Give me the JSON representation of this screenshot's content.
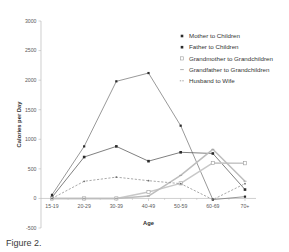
{
  "chart_data": {
    "type": "line",
    "title": "",
    "xlabel": "Age",
    "ylabel": "Calories per Day",
    "categories": [
      "15-19",
      "20-29",
      "30-39",
      "40-49",
      "50-59",
      "60-69",
      "70+"
    ],
    "ylim": [
      -500,
      3000
    ],
    "yticks": [
      -500,
      0,
      500,
      1000,
      1500,
      2000,
      2500,
      3000
    ],
    "ytick_labels": [
      "-500",
      "0",
      "500",
      "1000",
      "1500",
      "2000",
      "2500",
      "3000"
    ],
    "grid": false,
    "legend_position": "top-right",
    "series": [
      {
        "name": "Mother to Children",
        "marker": "small-filled-square",
        "line_style": "solid",
        "color": "#777777",
        "values": [
          60,
          880,
          1980,
          2120,
          1230,
          -20,
          30
        ]
      },
      {
        "name": "Father to Children",
        "marker": "filled-square",
        "line_style": "solid",
        "color": "#555555",
        "values": [
          20,
          700,
          880,
          630,
          780,
          760,
          150
        ]
      },
      {
        "name": "Grandmother to Grandchildren",
        "marker": "open-square",
        "line_style": "solid-light",
        "color": "#c8c8c8",
        "values": [
          0,
          0,
          0,
          110,
          255,
          600,
          595
        ]
      },
      {
        "name": "Grandfather to Grandchildren",
        "marker": "tiny-tick",
        "line_style": "solid-light",
        "color": "#bdbdbd",
        "values": [
          0,
          0,
          0,
          40,
          390,
          830,
          290
        ]
      },
      {
        "name": "Husband to Wife",
        "marker": "small-dot",
        "line_style": "dashed",
        "color": "#8c8c8c",
        "values": [
          0,
          290,
          360,
          300,
          250,
          -20,
          250
        ]
      }
    ]
  },
  "caption": {
    "text": "Figure 2."
  }
}
